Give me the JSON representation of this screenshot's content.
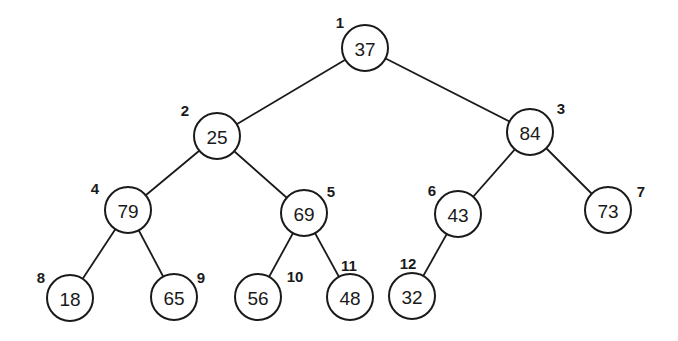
{
  "diagram": {
    "type": "binary-tree",
    "nodes": [
      {
        "index": "1",
        "value": "37",
        "cx": 365,
        "cy": 48,
        "lx": 340,
        "ly": 22
      },
      {
        "index": "2",
        "value": "25",
        "cx": 217,
        "cy": 136,
        "lx": 185,
        "ly": 110
      },
      {
        "index": "3",
        "value": "84",
        "cx": 530,
        "cy": 132,
        "lx": 561,
        "ly": 108
      },
      {
        "index": "4",
        "value": "79",
        "cx": 128,
        "cy": 210,
        "lx": 95,
        "ly": 188
      },
      {
        "index": "5",
        "value": "69",
        "cx": 304,
        "cy": 213,
        "lx": 331,
        "ly": 191
      },
      {
        "index": "6",
        "value": "43",
        "cx": 458,
        "cy": 214,
        "lx": 432,
        "ly": 190
      },
      {
        "index": "7",
        "value": "73",
        "cx": 608,
        "cy": 210,
        "lx": 641,
        "ly": 191
      },
      {
        "index": "8",
        "value": "18",
        "cx": 70,
        "cy": 298,
        "lx": 41,
        "ly": 277
      },
      {
        "index": "9",
        "value": "65",
        "cx": 174,
        "cy": 297,
        "lx": 201,
        "ly": 277
      },
      {
        "index": "10",
        "value": "56",
        "cx": 258,
        "cy": 297,
        "lx": 295,
        "ly": 276
      },
      {
        "index": "11",
        "value": "48",
        "cx": 350,
        "cy": 297,
        "lx": 349,
        "ly": 265
      },
      {
        "index": "12",
        "value": "32",
        "cx": 412,
        "cy": 296,
        "lx": 408,
        "ly": 263
      }
    ],
    "edges": [
      [
        0,
        1
      ],
      [
        0,
        2
      ],
      [
        1,
        3
      ],
      [
        1,
        4
      ],
      [
        2,
        5
      ],
      [
        2,
        6
      ],
      [
        3,
        7
      ],
      [
        3,
        8
      ],
      [
        4,
        9
      ],
      [
        4,
        10
      ],
      [
        5,
        11
      ]
    ],
    "radius": 23,
    "colors": {
      "stroke": "#1a1a1a",
      "fill": "#ffffff",
      "background": "#ffffff"
    }
  }
}
